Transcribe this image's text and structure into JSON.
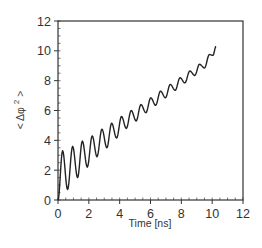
{
  "chart_data": {
    "type": "line",
    "title": "",
    "xlabel": "Time [ns]",
    "ylabel": "< Δφ 2 >",
    "ylabel_parts": {
      "open": "< Δφ ",
      "sup": "2",
      "close": " >"
    },
    "xlim": [
      0,
      12
    ],
    "ylim": [
      0,
      12
    ],
    "x_ticks": [
      0,
      2,
      4,
      6,
      8,
      10,
      12
    ],
    "y_ticks": [
      0,
      2,
      4,
      6,
      8,
      10,
      12
    ],
    "x_tick_labels": [
      "0",
      "2",
      "4",
      "6",
      "8",
      "10",
      "12"
    ],
    "y_tick_labels": [
      "0",
      "2",
      "4",
      "6",
      "8",
      "10",
      "12"
    ],
    "minor_tick_step": 0.5,
    "grid": false,
    "legend": null,
    "series": [
      {
        "name": "<Δφ²>",
        "color": "#222222",
        "description": "Oscillating, roughly linearly increasing curve with damped oscillations (period ≈ 0.63 ns)",
        "points": [
          [
            0.0,
            0.0
          ],
          [
            0.3,
            3.3
          ],
          [
            0.62,
            0.7
          ],
          [
            0.95,
            3.6
          ],
          [
            1.27,
            1.5
          ],
          [
            1.58,
            3.95
          ],
          [
            1.9,
            2.2
          ],
          [
            2.22,
            4.3
          ],
          [
            2.53,
            2.9
          ],
          [
            2.85,
            4.75
          ],
          [
            3.17,
            3.5
          ],
          [
            3.48,
            5.15
          ],
          [
            3.8,
            4.15
          ],
          [
            4.12,
            5.6
          ],
          [
            4.43,
            4.8
          ],
          [
            4.75,
            6.0
          ],
          [
            5.07,
            5.3
          ],
          [
            5.38,
            6.4
          ],
          [
            5.7,
            5.85
          ],
          [
            6.02,
            6.85
          ],
          [
            6.33,
            6.35
          ],
          [
            6.65,
            7.3
          ],
          [
            6.97,
            6.85
          ],
          [
            7.28,
            7.75
          ],
          [
            7.6,
            7.35
          ],
          [
            7.92,
            8.2
          ],
          [
            8.23,
            7.85
          ],
          [
            8.55,
            8.65
          ],
          [
            8.87,
            8.35
          ],
          [
            9.18,
            9.1
          ],
          [
            9.5,
            8.85
          ],
          [
            9.82,
            9.75
          ],
          [
            10.05,
            9.7
          ],
          [
            10.25,
            10.3
          ]
        ]
      }
    ]
  }
}
